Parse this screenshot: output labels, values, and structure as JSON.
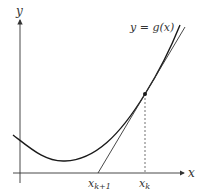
{
  "diagram": {
    "axis_x_label": "x",
    "axis_y_label": "y",
    "curve_label": "y = g(x)",
    "tick_labels": {
      "x_next": "x",
      "x_next_sub": "k+1",
      "x_current": "x",
      "x_current_sub": "k"
    },
    "colors": {
      "curve": "#1a1a1a",
      "tangent": "#333333",
      "axes": "#333333"
    }
  }
}
